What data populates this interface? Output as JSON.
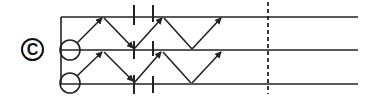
{
  "figure": {
    "panel_label": "C",
    "line_color": "#222222",
    "background": "#ffffff",
    "rails": [
      17,
      50,
      84
    ],
    "rail_x_start": 61,
    "rail_x_end": 358,
    "dashed_line_x": 268
  }
}
